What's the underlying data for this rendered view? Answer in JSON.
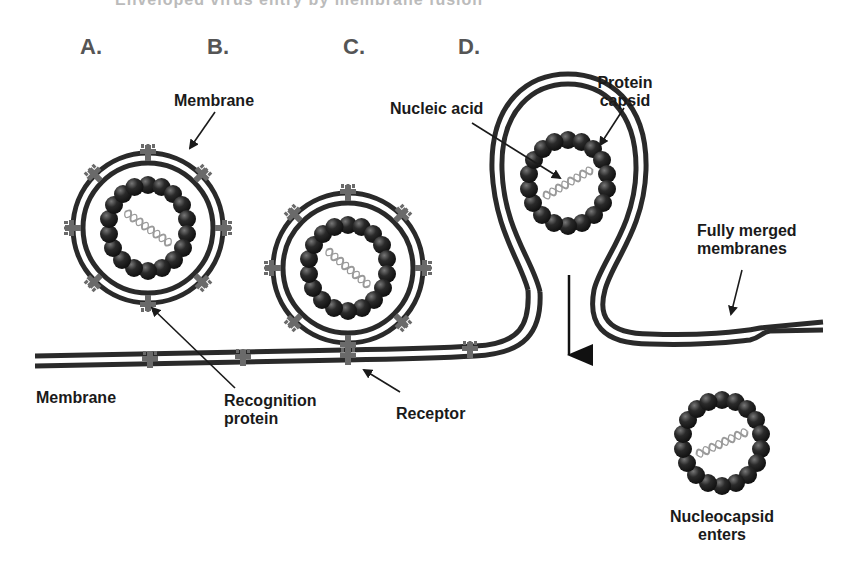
{
  "title_cutoff": "Enveloped virus entry by membrane fusion",
  "stages": {
    "a": "A.",
    "b": "B.",
    "c": "C.",
    "d": "D."
  },
  "labels": {
    "membrane_top": "Membrane",
    "nucleic_acid": "Nucleic acid",
    "protein_capsid_line1": "Protein",
    "protein_capsid_line2": "capsid",
    "fully_merged_line1": "Fully merged",
    "fully_merged_line2": "membranes",
    "membrane_bottom": "Membrane",
    "recognition_line1": "Recognition",
    "recognition_line2": "protein",
    "receptor": "Receptor",
    "nucleocapsid_line1": "Nucleocapsid",
    "nucleocapsid_line2": "enters"
  },
  "colors": {
    "membrane": "#2a2a2a",
    "protein": "#6a6a6a",
    "capsid_subunit": "#1e1e1e",
    "nucleic_acid": "#9a9a9a",
    "stage_letter": "#555555",
    "text": "#1a1a1a"
  }
}
